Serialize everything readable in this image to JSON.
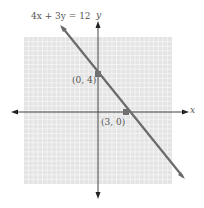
{
  "chart_data": {
    "type": "line",
    "title": "4x + 3y = 12",
    "xlabel": "x",
    "ylabel": "y",
    "xlim": [
      -8,
      8
    ],
    "ylim": [
      -8,
      8
    ],
    "grid": true,
    "series": [
      {
        "name": "4x + 3y = 12",
        "x": [
          -2.6,
          7.8
        ],
        "y": [
          7.5,
          -6.4
        ]
      }
    ],
    "points": [
      {
        "label": "(0, 4)",
        "x": 0,
        "y": 4
      },
      {
        "label": "(3, 0)",
        "x": 3,
        "y": 0
      }
    ]
  },
  "labels": {
    "equation": "4x + 3y = 12",
    "x_axis": "x",
    "y_axis": "y",
    "point_y_intercept": "(0, 4)",
    "point_x_intercept": "(3, 0)"
  },
  "colors": {
    "grid_bg": "#e4e4e4",
    "grid_line": "#f4f4f4",
    "line": "#6b6b6b",
    "axis": "#444444",
    "point": "#707070"
  }
}
